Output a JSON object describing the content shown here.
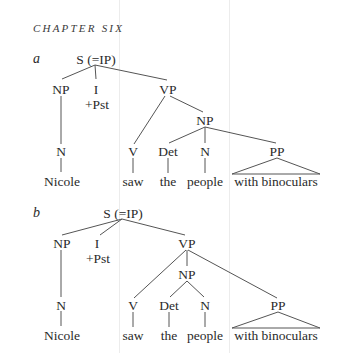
{
  "header": {
    "chapter": "CHAPTER SIX"
  },
  "trees": [
    {
      "label": "a",
      "nodes": {
        "s": "S (=IP)",
        "np_subj": "NP",
        "i": "I",
        "i_feat": "+Pst",
        "vp": "VP",
        "n_subj": "N",
        "w_subj": "Nicole",
        "v": "V",
        "np_obj": "NP",
        "det": "Det",
        "n_obj": "N",
        "pp": "PP",
        "w_v": "saw",
        "w_det": "the",
        "w_n": "people",
        "w_pp": "with binoculars"
      }
    },
    {
      "label": "b",
      "nodes": {
        "s": "S (=IP)",
        "np_subj": "NP",
        "i": "I",
        "i_feat": "+Pst",
        "vp": "VP",
        "n_subj": "N",
        "w_subj": "Nicole",
        "v": "V",
        "np_obj": "NP",
        "det": "Det",
        "n_obj": "N",
        "pp": "PP",
        "w_v": "saw",
        "w_det": "the",
        "w_n": "people",
        "w_pp": "with binoculars"
      }
    }
  ]
}
